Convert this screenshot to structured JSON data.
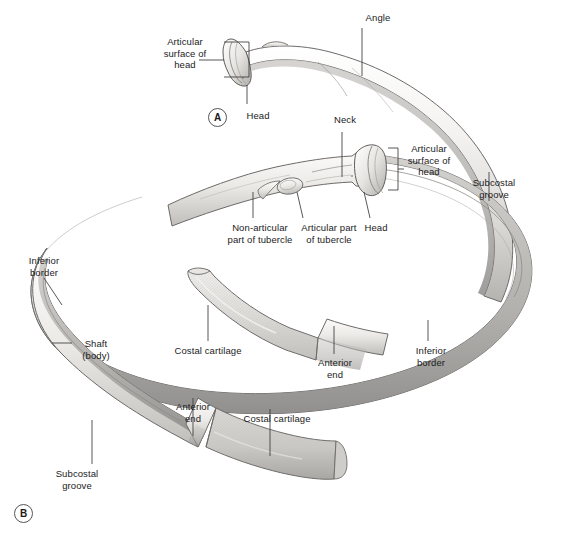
{
  "figure": {
    "background_color": "#ffffff",
    "label_color": "#1b1b1b",
    "leader_color": "#3a3a3a",
    "bone_fill": "#f2f1ef",
    "bone_shadow": "#b9b7b4",
    "bone_outline": "#6d6b69",
    "cartilage_fill": "#dedcd9"
  },
  "panels": [
    {
      "id": "panel-a",
      "tag": "A",
      "x": 208,
      "y": 108
    },
    {
      "id": "panel-b",
      "tag": "B",
      "x": 14,
      "y": 504
    }
  ],
  "labels": [
    {
      "id": "articular-surface-of-head-a",
      "text": "Articular\nsurface of\nhead",
      "x": 148,
      "y": 36,
      "width": 74,
      "align": "center"
    },
    {
      "id": "angle",
      "text": "Angle",
      "x": 356,
      "y": 12,
      "width": 44,
      "align": "center"
    },
    {
      "id": "head-a",
      "text": "Head",
      "x": 240,
      "y": 110,
      "width": 36,
      "align": "center"
    },
    {
      "id": "neck",
      "text": "Neck",
      "x": 327,
      "y": 114,
      "width": 36,
      "align": "center"
    },
    {
      "id": "articular-surface-of-head-b",
      "text": "Articular\nsurface of\nhead",
      "x": 398,
      "y": 143,
      "width": 62,
      "align": "center"
    },
    {
      "id": "subcostal-groove-right",
      "text": "Subcostal\ngroove",
      "x": 463,
      "y": 177,
      "width": 62,
      "align": "center"
    },
    {
      "id": "non-articular-part-of-tubercle",
      "text": "Non-articular\npart of tubercle",
      "x": 219,
      "y": 222,
      "width": 82,
      "align": "center"
    },
    {
      "id": "articular-part-of-tubercle",
      "text": "Articular part\nof tubercle",
      "x": 293,
      "y": 222,
      "width": 72,
      "align": "center"
    },
    {
      "id": "head-b",
      "text": "Head",
      "x": 358,
      "y": 222,
      "width": 36,
      "align": "center"
    },
    {
      "id": "inferior-border-left",
      "text": "Inferior\nborder",
      "x": 20,
      "y": 255,
      "width": 48,
      "align": "center"
    },
    {
      "id": "shaft-body",
      "text": "Shaft\n(body)",
      "x": 74,
      "y": 338,
      "width": 44,
      "align": "center"
    },
    {
      "id": "costal-cartilage-upper",
      "text": "Costal cartilage",
      "x": 165,
      "y": 345,
      "width": 86,
      "align": "center"
    },
    {
      "id": "anterior-end-upper",
      "text": "Anterior\nend",
      "x": 309,
      "y": 357,
      "width": 52,
      "align": "center"
    },
    {
      "id": "inferior-border-right",
      "text": "Inferior\nborder",
      "x": 407,
      "y": 345,
      "width": 48,
      "align": "center"
    },
    {
      "id": "anterior-end-lower",
      "text": "Anterior\nend",
      "x": 167,
      "y": 401,
      "width": 52,
      "align": "center"
    },
    {
      "id": "costal-cartilage-lower",
      "text": "Costal cartilage",
      "x": 234,
      "y": 413,
      "width": 86,
      "align": "center"
    },
    {
      "id": "subcostal-groove-left",
      "text": "Subcostal\ngroove",
      "x": 46,
      "y": 468,
      "width": 62,
      "align": "center"
    }
  ],
  "anatomy_parts": [
    "Articular surface of head",
    "Head",
    "Neck",
    "Angle",
    "Articular part of tubercle",
    "Non-articular part of tubercle",
    "Shaft (body)",
    "Inferior border",
    "Subcostal groove",
    "Anterior end",
    "Costal cartilage"
  ]
}
